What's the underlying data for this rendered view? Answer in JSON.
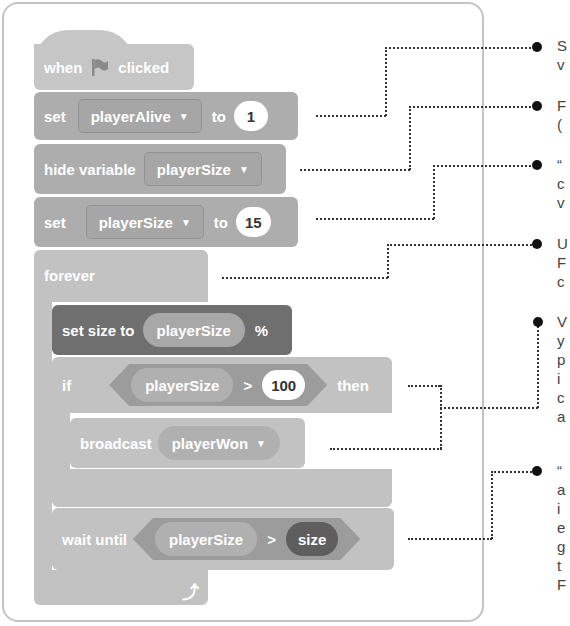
{
  "script": {
    "hat": {
      "when": "when",
      "flag_icon": "green-flag-icon",
      "clicked": "clicked"
    },
    "set_alive": {
      "set": "set",
      "variable": "playerAlive",
      "to": "to",
      "value": "1"
    },
    "hide_var": {
      "label": "hide variable",
      "variable": "playerSize"
    },
    "set_size_var": {
      "set": "set",
      "variable": "playerSize",
      "to": "to",
      "value": "15"
    },
    "forever": {
      "label": "forever",
      "loop_arrow_icon": "loop-arrow-icon"
    },
    "set_size": {
      "label": "set size to",
      "reporter": "playerSize",
      "unit": "%"
    },
    "if_block": {
      "if": "if",
      "reporter": "playerSize",
      "operator": ">",
      "value": "100",
      "then": "then"
    },
    "broadcast": {
      "label": "broadcast",
      "message": "playerWon"
    },
    "wait_until": {
      "label": "wait until",
      "reporter": "playerSize",
      "operator": ">",
      "other": "size"
    }
  },
  "annotations": [
    {
      "lines": [
        "S",
        "v"
      ]
    },
    {
      "lines": [
        "F",
        "("
      ]
    },
    {
      "lines": [
        "“",
        "c",
        "v"
      ]
    },
    {
      "lines": [
        "U",
        "F",
        "c"
      ]
    },
    {
      "lines": [
        "V",
        "y",
        "p",
        "i",
        "c",
        "a"
      ]
    },
    {
      "lines": [
        "“",
        "a",
        "i",
        "e",
        "g",
        "t",
        "F"
      ]
    }
  ],
  "colors": {
    "event": "#c6c6c6",
    "variable": "#adadad",
    "looks": "#6f6f6f",
    "control": "#c2c2c2",
    "operator": "#9c9c9c",
    "leader_line": "#333333"
  }
}
